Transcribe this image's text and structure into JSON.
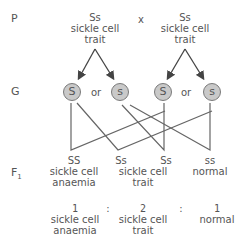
{
  "row_labels": {
    "parents": "P",
    "gametes": "G",
    "f1": "F",
    "f1_subscript": "1"
  },
  "parents": [
    {
      "genotype": "Ss",
      "phenotype_line1": "sickle cell",
      "phenotype_line2": "trait"
    },
    {
      "genotype": "Ss",
      "phenotype_line1": "sickle cell",
      "phenotype_line2": "trait"
    }
  ],
  "cross_symbol": "x",
  "gametes": [
    {
      "allele": "S"
    },
    {
      "allele": "s"
    },
    {
      "allele": "S"
    },
    {
      "allele": "s"
    }
  ],
  "gamete_separator": "or",
  "offspring": [
    {
      "genotype": "SS",
      "phenotype_line1": "sickle cell",
      "phenotype_line2": "anaemia"
    },
    {
      "genotype": "Ss",
      "phenotype_line1": "",
      "phenotype_line2": ""
    },
    {
      "genotype": "Ss",
      "phenotype_line1": "",
      "phenotype_line2": ""
    },
    {
      "genotype": "ss",
      "phenotype_line1": "normal",
      "phenotype_line2": ""
    }
  ],
  "offspring_shared_label": {
    "line1": "sickle cell",
    "line2": "trait"
  },
  "ratio": [
    {
      "value": "1",
      "label_line1": "sickle cell",
      "label_line2": "anaemia"
    },
    {
      "value": "2",
      "label_line1": "sickle cell",
      "label_line2": "trait"
    },
    {
      "value": "1",
      "label_line1": "normal",
      "label_line2": ""
    }
  ],
  "ratio_separator": ":",
  "colors": {
    "line": "#555555",
    "gamete_fill": "#c9c9c9",
    "gamete_border": "#7a7a7a",
    "text": "#555555"
  }
}
